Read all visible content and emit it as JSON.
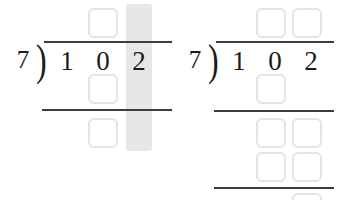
{
  "worksheet": {
    "title": "Long division practice: 102 divided by 7",
    "problem": {
      "dividend": "102",
      "divisor": "7",
      "operation": "long-division"
    },
    "highlight_color": "#e7e7e7",
    "ink_color": "#1b1b1b",
    "rule_color": "#3d3d3d",
    "box_border_color": "#e3e3e3"
  },
  "panels": [
    {
      "id": "panel-left",
      "name": "step-one",
      "divisor": "7",
      "bracket": ")",
      "dividend_digits": [
        "1",
        "0",
        "2"
      ],
      "highlight": {
        "label": "ones-column-highlight",
        "digit": "2"
      },
      "quotient_boxes": [
        {
          "value": "",
          "position": "quotient-tens"
        }
      ],
      "work_boxes": [
        {
          "value": "",
          "position": "partial-product-1"
        },
        {
          "value": "",
          "position": "remainder-1"
        }
      ],
      "rules": [
        {
          "name": "vinculum"
        },
        {
          "name": "subtraction-line-1"
        }
      ]
    },
    {
      "id": "panel-right",
      "name": "step-two",
      "divisor": "7",
      "bracket": ")",
      "dividend_digits": [
        "1",
        "0",
        "2"
      ],
      "quotient_boxes": [
        {
          "value": "",
          "position": "quotient-tens"
        },
        {
          "value": "",
          "position": "quotient-ones"
        }
      ],
      "work_boxes": [
        {
          "value": "",
          "position": "partial-product-1"
        },
        {
          "value": "",
          "position": "remainder-1-tens"
        },
        {
          "value": "",
          "position": "remainder-1-ones"
        },
        {
          "value": "",
          "position": "partial-product-2-tens"
        },
        {
          "value": "",
          "position": "partial-product-2-ones"
        },
        {
          "value": "",
          "position": "final-remainder"
        }
      ],
      "rules": [
        {
          "name": "vinculum"
        },
        {
          "name": "subtraction-line-1"
        },
        {
          "name": "subtraction-line-2"
        }
      ]
    }
  ]
}
